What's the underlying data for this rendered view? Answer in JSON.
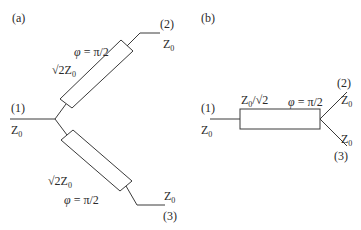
{
  "panel_a": {
    "label": "(a)",
    "port1": {
      "num": "(1)",
      "impedance": "Z",
      "sub": "0"
    },
    "port2": {
      "num": "(2)",
      "impedance": "Z",
      "sub": "0"
    },
    "port3": {
      "num": "(3)",
      "impedance": "Z",
      "sub": "0"
    },
    "upper_branch": {
      "impedance_prefix": "√2Z",
      "sub": "0",
      "phase_sym": "φ",
      "phase": " = π/2"
    },
    "lower_branch": {
      "impedance_prefix": "√2Z",
      "sub": "0",
      "phase_sym": "φ",
      "phase": " = π/2"
    }
  },
  "panel_b": {
    "label": "(b)",
    "port1": {
      "num": "(1)",
      "impedance": "Z",
      "sub": "0"
    },
    "port2": {
      "num": "(2)",
      "impedance": "Z",
      "sub": "0"
    },
    "port3": {
      "num": "(3)",
      "impedance": "Z",
      "sub": "0"
    },
    "line": {
      "impedance_prefix": "Z",
      "sub": "0",
      "impedance_suffix": "/√2",
      "phase_sym": "φ",
      "phase": " = π/2"
    }
  },
  "colors": {
    "stroke": "#3a3a3a",
    "background": "#ffffff"
  }
}
